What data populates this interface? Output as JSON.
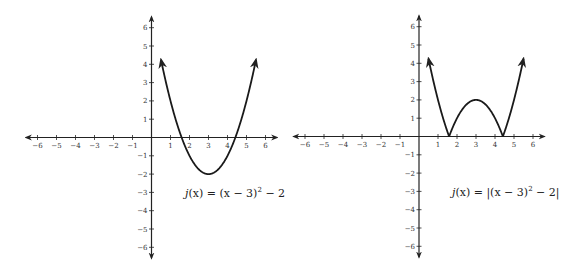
{
  "chart_data": [
    {
      "type": "line",
      "title": "",
      "equation_label": "j(x) = (x − 3)² − 2",
      "function": "(x-3)^2-2",
      "xlabel": "",
      "ylabel": "",
      "xlim": [
        -6,
        6
      ],
      "ylim": [
        -6,
        6
      ],
      "x_ticks": [
        -6,
        -5,
        -4,
        -3,
        -2,
        -1,
        1,
        2,
        3,
        4,
        5,
        6
      ],
      "y_ticks": [
        -6,
        -5,
        -4,
        -3,
        -2,
        -1,
        1,
        2,
        3,
        4,
        5,
        6
      ],
      "grid": false,
      "arrows_at_ends": true,
      "domain_drawn": [
        0.5,
        5.5
      ],
      "key_points": {
        "vertex": [
          3,
          -2
        ],
        "x_intercepts": [
          1.59,
          4.41
        ],
        "endpoints": [
          [
            0.5,
            4.25
          ],
          [
            5.5,
            4.25
          ]
        ]
      }
    },
    {
      "type": "line",
      "title": "",
      "equation_label": "j(x) = |(x − 3)² − 2|",
      "function": "abs((x-3)^2-2)",
      "xlabel": "",
      "ylabel": "",
      "xlim": [
        -6,
        6
      ],
      "ylim": [
        -6,
        6
      ],
      "x_ticks": [
        -6,
        -5,
        -4,
        -3,
        -2,
        -1,
        1,
        2,
        3,
        4,
        5,
        6
      ],
      "y_ticks": [
        -6,
        -5,
        -4,
        -3,
        -2,
        -1,
        1,
        2,
        3,
        4,
        5,
        6
      ],
      "grid": false,
      "arrows_at_ends": true,
      "domain_drawn": [
        0.5,
        5.5
      ],
      "key_points": {
        "local_max": [
          3,
          2
        ],
        "x_intercepts": [
          1.59,
          4.41
        ],
        "endpoints": [
          [
            0.5,
            4.25
          ],
          [
            5.5,
            4.25
          ]
        ]
      }
    }
  ],
  "graphs": [
    {
      "label_func": "j",
      "label_arg": "(x)",
      "label_eq": "= (x − 3)",
      "label_sup": "2",
      "label_tail": " − 2",
      "abs": false
    },
    {
      "label_func": "j",
      "label_arg": "(x)",
      "label_eq": "= |(x − 3)",
      "label_sup": "2",
      "label_tail": " − 2|",
      "abs": true
    }
  ],
  "colors": {
    "axis": "#222222",
    "curve": "#1a1a1a",
    "text": "#333333"
  }
}
